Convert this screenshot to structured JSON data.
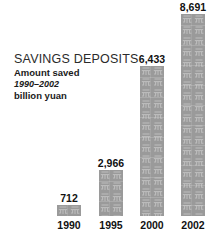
{
  "chart_data": {
    "type": "bar",
    "title": "SAVINGS DEPOSITS",
    "subtitle": "Amount saved",
    "period": "1990–2002",
    "units": "billion yuan",
    "xlabel": "",
    "ylabel": "billion yuan",
    "ylim": [
      0,
      8691
    ],
    "grid": false,
    "legend": "none",
    "categories": [
      "1990",
      "1995",
      "2000",
      "2002"
    ],
    "values": [
      712,
      2966,
      6433,
      8691
    ],
    "value_labels": [
      "712",
      "2,966",
      "6,433",
      "8,691"
    ],
    "bar_fill_color": "#9a9a9a",
    "bar_texture_glyph": "元",
    "text_color": "#111111",
    "title_color": "#2b2b2b",
    "background_color": "#ffffff"
  },
  "bars": [
    {
      "year": "1990",
      "value_label": "712",
      "value": 712,
      "height_px": 11
    },
    {
      "year": "1995",
      "value_label": "2,966",
      "value": 2966,
      "height_px": 46
    },
    {
      "year": "2000",
      "value_label": "6,433",
      "value": 6433,
      "height_px": 150
    },
    {
      "year": "2002",
      "value_label": "8,691",
      "value": 8691,
      "height_px": 202
    }
  ]
}
